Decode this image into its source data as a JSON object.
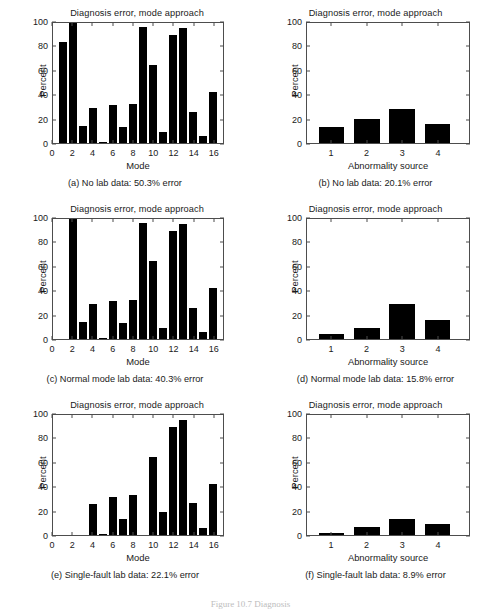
{
  "figure": {
    "caption_partial": "Figure 10.7   Diagnosis"
  },
  "axis": {
    "mode_ticks": [
      "0",
      "2",
      "4",
      "6",
      "8",
      "10",
      "12",
      "14",
      "16"
    ],
    "source_ticks": [
      "1",
      "2",
      "3",
      "4"
    ],
    "percent_ticks": [
      "0",
      "20",
      "40",
      "60",
      "80",
      "100"
    ],
    "ylabel": "Percent",
    "xlabel_mode": "Mode",
    "xlabel_source": "Abnormality source",
    "title": "Diagnosis error, mode approach"
  },
  "panels": [
    {
      "id": "a",
      "subcaption": "(a)  No lab data: 50.3% error"
    },
    {
      "id": "b",
      "subcaption": "(b)  No lab data: 20.1% error"
    },
    {
      "id": "c",
      "subcaption": "(c)  Normal mode lab data: 40.3% error"
    },
    {
      "id": "d",
      "subcaption": "(d)  Normal mode lab data: 15.8% error"
    },
    {
      "id": "e",
      "subcaption": "(e)  Single-fault lab data: 22.1% error"
    },
    {
      "id": "f",
      "subcaption": "(f)  Single-fault lab data: 8.9% error"
    }
  ],
  "chart_data": [
    {
      "panel": "a",
      "type": "bar",
      "title": "Diagnosis error, mode approach",
      "xlabel": "Mode",
      "ylabel": "Percent",
      "categories": [
        1,
        2,
        3,
        4,
        5,
        6,
        7,
        8,
        9,
        10,
        11,
        12,
        13,
        14,
        15,
        16
      ],
      "values": [
        84,
        100,
        14,
        29,
        0.5,
        32,
        13,
        32.5,
        97,
        65,
        9.5,
        90,
        96,
        26,
        6,
        42.5
      ],
      "xlim": [
        0,
        17
      ],
      "ylim": [
        0,
        100
      ],
      "grid": false,
      "legend": "none"
    },
    {
      "panel": "b",
      "type": "bar",
      "title": "Diagnosis error, mode approach",
      "xlabel": "Abnormality source",
      "ylabel": "Percent",
      "categories": [
        1,
        2,
        3,
        4
      ],
      "values": [
        13.5,
        20,
        28.5,
        16
      ],
      "xlim": [
        0.3,
        4.9
      ],
      "ylim": [
        0,
        100
      ],
      "grid": false,
      "legend": "none"
    },
    {
      "panel": "c",
      "type": "bar",
      "title": "Diagnosis error, mode approach",
      "xlabel": "Mode",
      "ylabel": "Percent",
      "categories": [
        1,
        2,
        3,
        4,
        5,
        6,
        7,
        8,
        9,
        10,
        11,
        12,
        13,
        14,
        15,
        16
      ],
      "values": [
        0,
        100,
        14,
        29,
        0.5,
        32,
        13,
        32.5,
        97,
        65,
        9.5,
        90,
        96,
        26,
        6,
        42.5
      ],
      "xlim": [
        0,
        17
      ],
      "ylim": [
        0,
        100
      ],
      "grid": false,
      "legend": "none"
    },
    {
      "panel": "d",
      "type": "bar",
      "title": "Diagnosis error, mode approach",
      "xlabel": "Abnormality source",
      "ylabel": "Percent",
      "categories": [
        1,
        2,
        3,
        4
      ],
      "values": [
        4.5,
        9.5,
        29,
        16
      ],
      "xlim": [
        0.3,
        4.9
      ],
      "ylim": [
        0,
        100
      ],
      "grid": false,
      "legend": "none"
    },
    {
      "panel": "e",
      "type": "bar",
      "title": "Diagnosis error, mode approach",
      "xlabel": "Mode",
      "ylabel": "Percent",
      "categories": [
        1,
        2,
        3,
        4,
        5,
        6,
        7,
        8,
        9,
        10,
        11,
        12,
        13,
        14,
        15,
        16
      ],
      "values": [
        0,
        0,
        0,
        26,
        0.5,
        32,
        13,
        33,
        0,
        65,
        19.5,
        90,
        96,
        26.5,
        6,
        42.5
      ],
      "xlim": [
        0,
        17
      ],
      "ylim": [
        0,
        100
      ],
      "grid": false,
      "legend": "none"
    },
    {
      "panel": "f",
      "type": "bar",
      "title": "Diagnosis error, mode approach",
      "xlabel": "Abnormality source",
      "ylabel": "Percent",
      "categories": [
        1,
        2,
        3,
        4
      ],
      "values": [
        2,
        6.5,
        13.5,
        9.5
      ],
      "xlim": [
        0.3,
        4.9
      ],
      "ylim": [
        0,
        100
      ],
      "grid": false,
      "legend": "none"
    }
  ]
}
